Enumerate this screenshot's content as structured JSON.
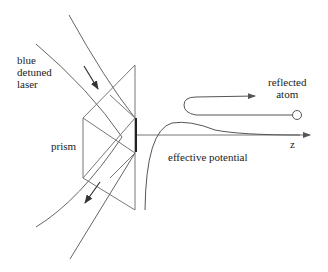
{
  "labels": {
    "laser": [
      "blue",
      "detuned",
      "laser"
    ],
    "prism": "prism",
    "atom": [
      "reflected",
      "atom"
    ],
    "potential": "effective potential",
    "axis": "z"
  },
  "colors": {
    "line": "#777777",
    "dark_line": "#333333",
    "text": "#222222",
    "background": "#ffffff"
  },
  "elements": {
    "laser_beam": "incoming and outgoing curved laser beams",
    "prism": "hexagonal prism with reflecting face",
    "atom": "circle at end of trajectory",
    "trajectory": "U-turn arrow path of reflected atom",
    "potential_curve": "effective potential barrier curve",
    "z_axis": "horizontal axis arrow labelled z"
  }
}
